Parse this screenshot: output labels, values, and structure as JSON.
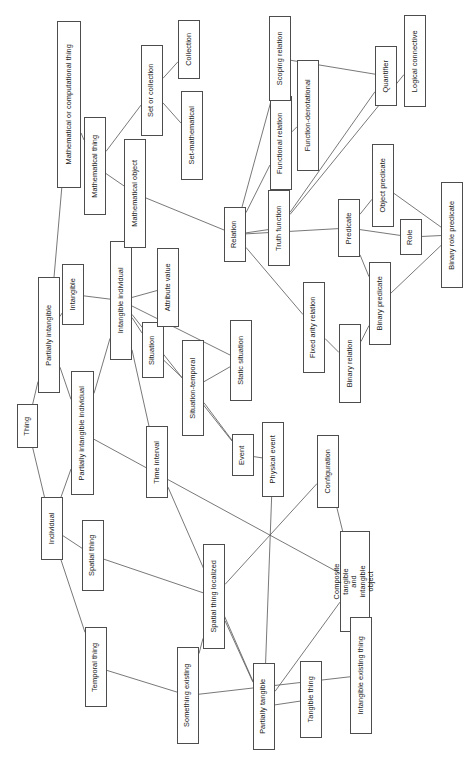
{
  "diagram": {
    "orientation": "rotated-90-ccw",
    "background_color": "#ffffff",
    "box_border_color": "#4d4d4d",
    "edge_color": "#555555",
    "text_color": "#1a1a1a",
    "nodes": [
      {
        "id": "thing",
        "label": "Thing",
        "x": 17,
        "y": 404,
        "w": 21,
        "h": 44
      },
      {
        "id": "partially_intangible",
        "label": "Partially intangible",
        "x": 38,
        "y": 277,
        "w": 22,
        "h": 116
      },
      {
        "id": "individual",
        "label": "Individual",
        "x": 41,
        "y": 497,
        "w": 22,
        "h": 63
      },
      {
        "id": "math_or_comp_thing",
        "label": "Mathematical or computational thing",
        "x": 57,
        "y": 21,
        "w": 24,
        "h": 167
      },
      {
        "id": "partially_intangible_individual",
        "label": "Partially intangible individual",
        "x": 71,
        "y": 371,
        "w": 23,
        "h": 124
      },
      {
        "id": "intangible",
        "label": "Intangible",
        "x": 62,
        "y": 264,
        "w": 22,
        "h": 61
      },
      {
        "id": "temporal_thing",
        "label": "Temporal thing",
        "x": 85,
        "y": 627,
        "w": 22,
        "h": 80
      },
      {
        "id": "spatial_thing",
        "label": "Spatial thing",
        "x": 82,
        "y": 520,
        "w": 22,
        "h": 71
      },
      {
        "id": "math_thing",
        "label": "Mathematical  thing",
        "x": 84,
        "y": 117,
        "w": 22,
        "h": 98
      },
      {
        "id": "intangible_individual",
        "label": "Intangible individual",
        "x": 110,
        "y": 241,
        "w": 22,
        "h": 119
      },
      {
        "id": "math_object",
        "label": "Mathematical object",
        "x": 124,
        "y": 139,
        "w": 22,
        "h": 109
      },
      {
        "id": "set_or_collection",
        "label": "Set or collection",
        "x": 141,
        "y": 45,
        "w": 22,
        "h": 91
      },
      {
        "id": "collection",
        "label": "Collection",
        "x": 178,
        "y": 20,
        "w": 22,
        "h": 59
      },
      {
        "id": "set_mathematical",
        "label": "Set-mathematical",
        "x": 181,
        "y": 91,
        "w": 22,
        "h": 89
      },
      {
        "id": "situation",
        "label": "Situation",
        "x": 142,
        "y": 322,
        "w": 22,
        "h": 56
      },
      {
        "id": "attribute_value",
        "label": "Attribute value",
        "x": 157,
        "y": 248,
        "w": 22,
        "h": 79
      },
      {
        "id": "time_interval",
        "label": "Time interval",
        "x": 146,
        "y": 426,
        "w": 22,
        "h": 72
      },
      {
        "id": "situation_temporal",
        "label": "Situation-temporal",
        "x": 182,
        "y": 340,
        "w": 22,
        "h": 96
      },
      {
        "id": "static_situation",
        "label": "Static situation",
        "x": 230,
        "y": 320,
        "w": 22,
        "h": 81
      },
      {
        "id": "event",
        "label": "Event",
        "x": 232,
        "y": 434,
        "w": 22,
        "h": 42
      },
      {
        "id": "physical_event",
        "label": "Physical event",
        "x": 262,
        "y": 422,
        "w": 22,
        "h": 75
      },
      {
        "id": "spatial_thing_localized",
        "label": "Spatial thing localized",
        "x": 203,
        "y": 544,
        "w": 22,
        "h": 105
      },
      {
        "id": "something_existing",
        "label": "Something existing",
        "x": 177,
        "y": 647,
        "w": 22,
        "h": 97
      },
      {
        "id": "configuration",
        "label": "Configuration",
        "x": 317,
        "y": 435,
        "w": 22,
        "h": 73
      },
      {
        "id": "relation",
        "label": "Relation",
        "x": 224,
        "y": 207,
        "w": 22,
        "h": 55
      },
      {
        "id": "truth_function",
        "label": "Truth function",
        "x": 268,
        "y": 190,
        "w": 22,
        "h": 76
      },
      {
        "id": "functional_relation",
        "label": "Functional relation",
        "x": 270,
        "y": 96,
        "w": 22,
        "h": 94
      },
      {
        "id": "scoping_relation",
        "label": "Scoping relation",
        "x": 269,
        "y": 16,
        "w": 22,
        "h": 85
      },
      {
        "id": "function_denotational",
        "label": "Function-denotational",
        "x": 297,
        "y": 60,
        "w": 22,
        "h": 111
      },
      {
        "id": "quantifier",
        "label": "Quantifier",
        "x": 375,
        "y": 46,
        "w": 22,
        "h": 60
      },
      {
        "id": "logical_connective",
        "label": "Logical connective",
        "x": 404,
        "y": 15,
        "w": 22,
        "h": 92
      },
      {
        "id": "fixed_arity_relation",
        "label": "Fixed arity relation",
        "x": 303,
        "y": 282,
        "w": 22,
        "h": 91
      },
      {
        "id": "predicate",
        "label": "Predicate",
        "x": 338,
        "y": 199,
        "w": 22,
        "h": 58
      },
      {
        "id": "object_predicate",
        "label": "Object predicate",
        "x": 372,
        "y": 144,
        "w": 22,
        "h": 83
      },
      {
        "id": "role",
        "label": "Role",
        "x": 400,
        "y": 219,
        "w": 22,
        "h": 36
      },
      {
        "id": "binary_role_predicate",
        "label": "Binary role predicate",
        "x": 441,
        "y": 182,
        "w": 22,
        "h": 106
      },
      {
        "id": "binary_predicate",
        "label": "Binary predicate",
        "x": 369,
        "y": 262,
        "w": 22,
        "h": 83
      },
      {
        "id": "binary_relation",
        "label": "Binary relation",
        "x": 339,
        "y": 324,
        "w": 22,
        "h": 79
      },
      {
        "id": "composite_tangible_and_intangible_object",
        "label": "Composite tangible\nand intangible object",
        "x": 340,
        "y": 531,
        "w": 30,
        "h": 101
      },
      {
        "id": "intangible_existing_thing",
        "label": "Intangible existing thing",
        "x": 350,
        "y": 617,
        "w": 22,
        "h": 117
      },
      {
        "id": "partially_tangible",
        "label": "Partially tangible",
        "x": 253,
        "y": 663,
        "w": 22,
        "h": 87
      },
      {
        "id": "tangible_thing",
        "label": "Tangible thing",
        "x": 300,
        "y": 661,
        "w": 22,
        "h": 77
      }
    ],
    "edges": [
      {
        "from": "thing",
        "to": "partially_intangible"
      },
      {
        "from": "thing",
        "to": "individual"
      },
      {
        "from": "partially_intangible",
        "to": "math_or_comp_thing"
      },
      {
        "from": "partially_intangible",
        "to": "intangible"
      },
      {
        "from": "partially_intangible",
        "to": "partially_intangible_individual"
      },
      {
        "from": "individual",
        "to": "partially_intangible_individual"
      },
      {
        "from": "individual",
        "to": "spatial_thing"
      },
      {
        "from": "individual",
        "to": "temporal_thing"
      },
      {
        "from": "math_or_comp_thing",
        "to": "math_thing"
      },
      {
        "from": "math_thing",
        "to": "set_or_collection"
      },
      {
        "from": "math_thing",
        "to": "math_object"
      },
      {
        "from": "set_or_collection",
        "to": "collection"
      },
      {
        "from": "set_or_collection",
        "to": "set_mathematical"
      },
      {
        "from": "intangible",
        "to": "intangible_individual"
      },
      {
        "from": "partially_intangible_individual",
        "to": "intangible_individual"
      },
      {
        "from": "intangible_individual",
        "to": "math_object"
      },
      {
        "from": "intangible_individual",
        "to": "attribute_value"
      },
      {
        "from": "intangible_individual",
        "to": "situation"
      },
      {
        "from": "intangible_individual",
        "to": "time_interval"
      },
      {
        "from": "intangible_individual",
        "to": "static_situation"
      },
      {
        "from": "intangible_individual",
        "to": "event"
      },
      {
        "from": "math_object",
        "to": "relation"
      },
      {
        "from": "situation",
        "to": "situation_temporal"
      },
      {
        "from": "situation_temporal",
        "to": "static_situation"
      },
      {
        "from": "situation_temporal",
        "to": "event"
      },
      {
        "from": "event",
        "to": "physical_event"
      },
      {
        "from": "relation",
        "to": "scoping_relation"
      },
      {
        "from": "relation",
        "to": "functional_relation"
      },
      {
        "from": "relation",
        "to": "truth_function"
      },
      {
        "from": "relation",
        "to": "fixed_arity_relation"
      },
      {
        "from": "relation",
        "to": "predicate"
      },
      {
        "from": "functional_relation",
        "to": "function_denotational"
      },
      {
        "from": "scoping_relation",
        "to": "quantifier"
      },
      {
        "from": "truth_function",
        "to": "quantifier"
      },
      {
        "from": "truth_function",
        "to": "logical_connective"
      },
      {
        "from": "predicate",
        "to": "object_predicate"
      },
      {
        "from": "predicate",
        "to": "role"
      },
      {
        "from": "predicate",
        "to": "binary_predicate"
      },
      {
        "from": "object_predicate",
        "to": "binary_role_predicate"
      },
      {
        "from": "role",
        "to": "binary_role_predicate"
      },
      {
        "from": "binary_predicate",
        "to": "binary_role_predicate"
      },
      {
        "from": "fixed_arity_relation",
        "to": "binary_relation"
      },
      {
        "from": "binary_relation",
        "to": "binary_predicate"
      },
      {
        "from": "partially_intangible_individual",
        "to": "composite_tangible_and_intangible_object"
      },
      {
        "from": "spatial_thing",
        "to": "spatial_thing_localized"
      },
      {
        "from": "temporal_thing",
        "to": "something_existing"
      },
      {
        "from": "time_interval",
        "to": "partially_tangible"
      },
      {
        "from": "spatial_thing_localized",
        "to": "something_existing"
      },
      {
        "from": "spatial_thing_localized",
        "to": "partially_tangible"
      },
      {
        "from": "spatial_thing_localized",
        "to": "configuration"
      },
      {
        "from": "something_existing",
        "to": "intangible_existing_thing"
      },
      {
        "from": "physical_event",
        "to": "partially_tangible"
      },
      {
        "from": "configuration",
        "to": "composite_tangible_and_intangible_object"
      },
      {
        "from": "partially_tangible",
        "to": "tangible_thing"
      },
      {
        "from": "partially_tangible",
        "to": "composite_tangible_and_intangible_object"
      },
      {
        "from": "intangible_existing_thing",
        "to": "composite_tangible_and_intangible_object"
      }
    ]
  }
}
